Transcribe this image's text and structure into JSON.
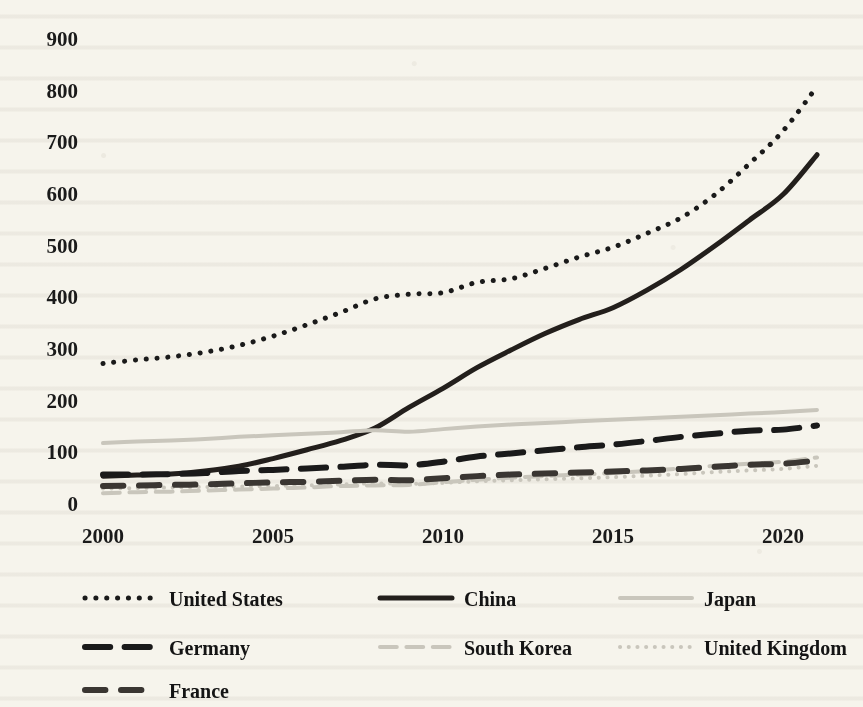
{
  "figure": {
    "background_color": "#f6f4ec",
    "ink_color": "#1a1a1a"
  },
  "chart_data": {
    "type": "line",
    "title": "",
    "subtitle": "",
    "xlabel": "",
    "ylabel": "",
    "xlim": [
      2000,
      2021
    ],
    "ylim": [
      0,
      930
    ],
    "grid": false,
    "legend_position": "below",
    "x_tick_labels": [
      "2000",
      "2005",
      "2010",
      "2015",
      "2020"
    ],
    "x_ticks": [
      2000,
      2005,
      2010,
      2015,
      2020
    ],
    "y_tick_labels": [
      "0",
      "100",
      "200",
      "300",
      "400",
      "500",
      "600",
      "700",
      "800",
      "900"
    ],
    "y_ticks": [
      0,
      100,
      200,
      300,
      400,
      500,
      600,
      700,
      800,
      900
    ],
    "x": [
      2000,
      2001,
      2002,
      2003,
      2004,
      2005,
      2006,
      2007,
      2008,
      2009,
      2010,
      2011,
      2012,
      2013,
      2014,
      2015,
      2016,
      2017,
      2018,
      2019,
      2020,
      2021
    ],
    "series": [
      {
        "name": "United States",
        "style": "dotted",
        "color": "#1a1a1a",
        "width": 5,
        "values": [
          270,
          277,
          283,
          292,
          305,
          323,
          345,
          369,
          395,
          404,
          407,
          427,
          434,
          454,
          476,
          495,
          522,
          552,
          597,
          656,
          720,
          806
        ]
      },
      {
        "name": "China",
        "style": "solid",
        "color": "#231f1c",
        "width": 5,
        "values": [
          52,
          54,
          56,
          62,
          71,
          86,
          103,
          121,
          145,
          185,
          222,
          262,
          296,
          328,
          355,
          378,
          412,
          452,
          498,
          547,
          597,
          674
        ]
      },
      {
        "name": "Japan",
        "style": "solid",
        "color": "#c9c6bc",
        "width": 4,
        "values": [
          116,
          119,
          121,
          124,
          128,
          131,
          134,
          137,
          141,
          138,
          143,
          148,
          152,
          155,
          158,
          161,
          164,
          167,
          170,
          173,
          176,
          180
        ]
      },
      {
        "name": "Germany",
        "style": "dashdot",
        "color": "#1a1a1a",
        "width": 6,
        "values": [
          55,
          55,
          56,
          58,
          62,
          64,
          67,
          70,
          74,
          73,
          80,
          90,
          96,
          102,
          108,
          113,
          120,
          128,
          134,
          140,
          142,
          150
        ]
      },
      {
        "name": "South Korea",
        "style": "dashdot",
        "color": "#c9c6bc",
        "width": 4,
        "values": [
          19,
          21,
          22,
          24,
          26,
          28,
          30,
          33,
          34,
          35,
          40,
          45,
          49,
          52,
          55,
          58,
          62,
          67,
          72,
          76,
          80,
          88
        ]
      },
      {
        "name": "United Kingdom",
        "style": "dotted",
        "color": "#c9c6bc",
        "width": 4,
        "values": [
          28,
          29,
          30,
          31,
          32,
          33,
          34,
          36,
          38,
          37,
          39,
          42,
          44,
          46,
          48,
          50,
          53,
          56,
          60,
          63,
          66,
          72
        ]
      },
      {
        "name": "France",
        "style": "dashed",
        "color": "#3a3632",
        "width": 6,
        "values": [
          33,
          34,
          35,
          36,
          38,
          40,
          41,
          43,
          45,
          44,
          48,
          52,
          55,
          57,
          59,
          61,
          63,
          66,
          70,
          74,
          76,
          82
        ]
      }
    ]
  },
  "legend": {
    "entries": [
      {
        "label": "United States",
        "key": "united-states"
      },
      {
        "label": "China",
        "key": "china"
      },
      {
        "label": "Japan",
        "key": "japan"
      },
      {
        "label": "Germany",
        "key": "germany"
      },
      {
        "label": "South Korea",
        "key": "south-korea"
      },
      {
        "label": "United Kingdom",
        "key": "united-kingdom"
      },
      {
        "label": "France",
        "key": "france"
      }
    ]
  }
}
